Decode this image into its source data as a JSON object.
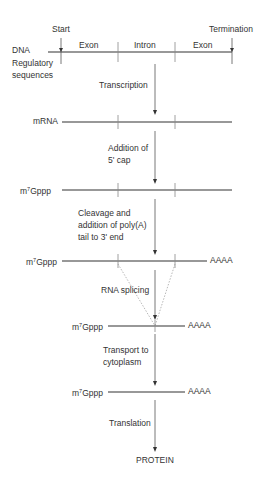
{
  "dna": {
    "label": "DNA",
    "start": "Start",
    "termination": "Termination",
    "regulatory_1": "Regulatory",
    "regulatory_2": "sequences",
    "segments": [
      "Exon",
      "Intron",
      "Exon"
    ]
  },
  "steps": {
    "transcription": "Transcription",
    "cap_1": "Addition of",
    "cap_2": "5' cap",
    "polya_1": "Cleavage and",
    "polya_2": "addition of poly(A)",
    "polya_3": "tail to 3' end",
    "splicing": "RNA splicing",
    "transport_1": "Transport to",
    "transport_2": "cytoplasm",
    "translation": "Translation"
  },
  "molecules": {
    "mrna": "mRNA",
    "cap_m": "m",
    "cap_sup": "7",
    "cap_rest": "Gppp",
    "tail": "AAAA",
    "protein": "PROTEIN"
  },
  "colors": {
    "line": "#333333",
    "dotted": "#888888"
  }
}
